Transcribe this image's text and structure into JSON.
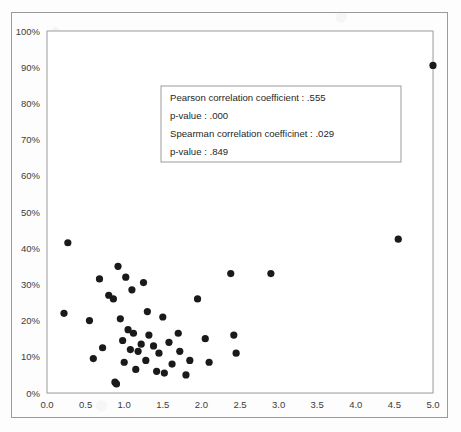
{
  "chart_data": {
    "type": "scatter",
    "title": "",
    "xlabel": "",
    "ylabel": "",
    "xlim": [
      0.0,
      5.0
    ],
    "ylim": [
      0,
      1.0
    ],
    "grid": true,
    "legend": null,
    "marker_color": "#1a1a1a",
    "gridline_color": "#ececec",
    "border_color": "#a6a6a6",
    "x_ticks": [
      "0.0",
      "0.5",
      "1.0",
      "1.5",
      "2.0",
      "2.5",
      "3.0",
      "3.5",
      "4.0",
      "4.5",
      "5.0"
    ],
    "x_tick_values": [
      0.0,
      0.5,
      1.0,
      1.5,
      2.0,
      2.5,
      3.0,
      3.5,
      4.0,
      4.5,
      5.0
    ],
    "y_ticks": [
      "0%",
      "10%",
      "20%",
      "30%",
      "40%",
      "50%",
      "60%",
      "70%",
      "80%",
      "90%",
      "100%"
    ],
    "y_tick_values": [
      0,
      10,
      20,
      30,
      40,
      50,
      60,
      70,
      80,
      90,
      100
    ],
    "points": [
      {
        "x": 0.22,
        "y": 22.0
      },
      {
        "x": 0.27,
        "y": 41.5
      },
      {
        "x": 0.55,
        "y": 20.0
      },
      {
        "x": 0.6,
        "y": 9.5
      },
      {
        "x": 0.68,
        "y": 31.5
      },
      {
        "x": 0.72,
        "y": 12.5
      },
      {
        "x": 0.8,
        "y": 27.0
      },
      {
        "x": 0.86,
        "y": 26.0
      },
      {
        "x": 0.88,
        "y": 3.0
      },
      {
        "x": 0.9,
        "y": 2.5
      },
      {
        "x": 0.92,
        "y": 35.0
      },
      {
        "x": 0.95,
        "y": 20.5
      },
      {
        "x": 0.98,
        "y": 14.5
      },
      {
        "x": 1.0,
        "y": 8.5
      },
      {
        "x": 1.02,
        "y": 32.0
      },
      {
        "x": 1.05,
        "y": 17.5
      },
      {
        "x": 1.08,
        "y": 12.0
      },
      {
        "x": 1.1,
        "y": 28.5
      },
      {
        "x": 1.12,
        "y": 16.5
      },
      {
        "x": 1.15,
        "y": 6.5
      },
      {
        "x": 1.18,
        "y": 11.5
      },
      {
        "x": 1.22,
        "y": 13.5
      },
      {
        "x": 1.25,
        "y": 30.5
      },
      {
        "x": 1.28,
        "y": 9.0
      },
      {
        "x": 1.3,
        "y": 22.5
      },
      {
        "x": 1.32,
        "y": 16.0
      },
      {
        "x": 1.38,
        "y": 13.0
      },
      {
        "x": 1.42,
        "y": 6.0
      },
      {
        "x": 1.45,
        "y": 11.0
      },
      {
        "x": 1.5,
        "y": 21.0
      },
      {
        "x": 1.52,
        "y": 5.5
      },
      {
        "x": 1.58,
        "y": 14.0
      },
      {
        "x": 1.62,
        "y": 8.0
      },
      {
        "x": 1.7,
        "y": 16.5
      },
      {
        "x": 1.72,
        "y": 11.5
      },
      {
        "x": 1.8,
        "y": 5.0
      },
      {
        "x": 1.85,
        "y": 9.0
      },
      {
        "x": 1.95,
        "y": 26.0
      },
      {
        "x": 2.05,
        "y": 15.0
      },
      {
        "x": 2.1,
        "y": 8.5
      },
      {
        "x": 2.38,
        "y": 33.0
      },
      {
        "x": 2.42,
        "y": 16.0
      },
      {
        "x": 2.45,
        "y": 11.0
      },
      {
        "x": 2.9,
        "y": 33.0
      },
      {
        "x": 4.55,
        "y": 42.5
      },
      {
        "x": 5.0,
        "y": 90.5
      }
    ],
    "annotation": {
      "lines": [
        "Pearson correlation coefficient : .555",
        "p-value : .000",
        "Spearman correlation coefficinet : .029",
        "p-value : .849"
      ],
      "pearson_label": "Pearson correlation coefficient",
      "pearson_value": ".555",
      "pearson_p_label": "p-value",
      "pearson_p_value": ".000",
      "spearman_label": "Spearman correlation coefficinet",
      "spearman_value": ".029",
      "spearman_p_label": "p-value",
      "spearman_p_value": ".849"
    }
  }
}
